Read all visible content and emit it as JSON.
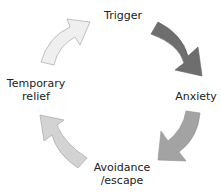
{
  "diagram": {
    "type": "cycle",
    "nodes": [
      {
        "id": "trigger",
        "label": "Trigger"
      },
      {
        "id": "anxiety",
        "label": "Anxiety"
      },
      {
        "id": "avoidance",
        "label": "Avoidance\n/escape",
        "lines": [
          "Avoidance",
          "/escape"
        ]
      },
      {
        "id": "relief",
        "label": "Temporary\nrelief",
        "lines": [
          "Temporary",
          "relief"
        ]
      }
    ],
    "arrows": [
      {
        "from": "trigger",
        "to": "anxiety",
        "color": "#6e6e6e"
      },
      {
        "from": "anxiety",
        "to": "avoidance",
        "color": "#a3a3a3"
      },
      {
        "from": "avoidance",
        "to": "relief",
        "color": "#d3d3d3"
      },
      {
        "from": "relief",
        "to": "trigger",
        "color": "#efefef"
      }
    ]
  }
}
